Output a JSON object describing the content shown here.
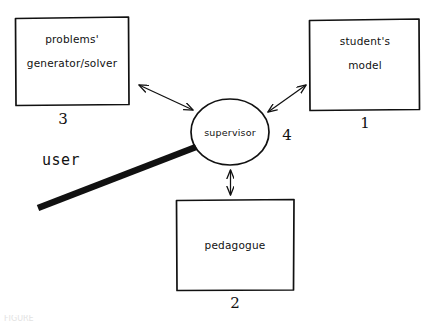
{
  "figure": {
    "kind": "hand-drawn-block-diagram",
    "background_color": "#ffffff",
    "ink_color": "#111111",
    "caption_partial": "FIGURE"
  },
  "nodes": {
    "problems_generator_solver": {
      "line1": "problems'",
      "line2": "generator/solver",
      "index": "3",
      "shape": "rectangle"
    },
    "students_model": {
      "line1": "student's",
      "line2": "model",
      "index": "1",
      "shape": "rectangle"
    },
    "pedagogue": {
      "line1": "pedagogue",
      "index": "2",
      "shape": "rectangle"
    },
    "supervisor": {
      "line1": "supervisor",
      "index": "4",
      "shape": "circle"
    },
    "user": {
      "label": "user",
      "shape": "thick-line"
    }
  },
  "connections": [
    {
      "name": "supervisor-to-problems-generator-solver",
      "from": "supervisor",
      "to": "problems_generator_solver",
      "arrow": "double-headed"
    },
    {
      "name": "supervisor-to-students-model",
      "from": "supervisor",
      "to": "students_model",
      "arrow": "double-headed"
    },
    {
      "name": "supervisor-to-pedagogue",
      "from": "supervisor",
      "to": "pedagogue",
      "arrow": "double-headed"
    },
    {
      "name": "user-to-supervisor",
      "from": "user",
      "to": "supervisor",
      "arrow": "none"
    }
  ]
}
